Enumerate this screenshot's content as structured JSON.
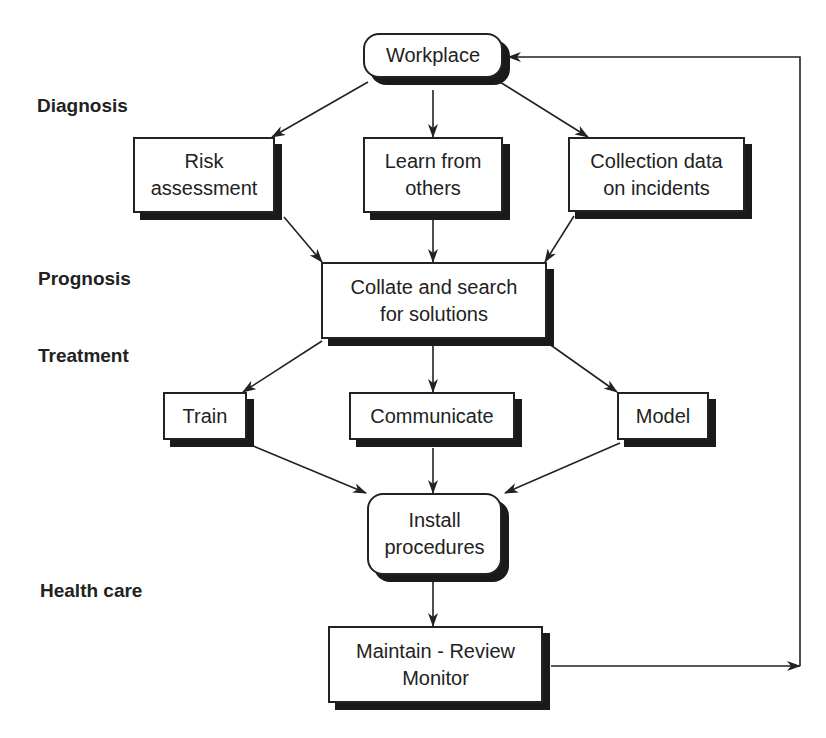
{
  "stages": [
    {
      "label": "Diagnosis"
    },
    {
      "label": "Prognosis"
    },
    {
      "label": "Treatment"
    },
    {
      "label": "Health care"
    }
  ],
  "nodes": {
    "workplace": {
      "label": "Workplace"
    },
    "risk": {
      "label": "Risk\nassessment"
    },
    "learn": {
      "label": "Learn from\nothers"
    },
    "collect": {
      "label": "Collection data\non incidents"
    },
    "collate": {
      "label": "Collate and search\nfor solutions"
    },
    "train": {
      "label": "Train"
    },
    "communicate": {
      "label": "Communicate"
    },
    "model": {
      "label": "Model"
    },
    "install": {
      "label": "Install\nprocedures"
    },
    "maintain": {
      "label": "Maintain - Review\nMonitor"
    }
  },
  "edges": [
    {
      "from": "workplace",
      "to": "risk"
    },
    {
      "from": "workplace",
      "to": "learn"
    },
    {
      "from": "workplace",
      "to": "collect"
    },
    {
      "from": "risk",
      "to": "collate"
    },
    {
      "from": "learn",
      "to": "collate"
    },
    {
      "from": "collect",
      "to": "collate"
    },
    {
      "from": "collate",
      "to": "train"
    },
    {
      "from": "collate",
      "to": "communicate"
    },
    {
      "from": "collate",
      "to": "model"
    },
    {
      "from": "train",
      "to": "install"
    },
    {
      "from": "communicate",
      "to": "install"
    },
    {
      "from": "model",
      "to": "install"
    },
    {
      "from": "install",
      "to": "maintain"
    },
    {
      "from": "maintain",
      "to": "workplace",
      "type": "feedback-loop"
    }
  ],
  "colors": {
    "line": "#222222",
    "shadow": "#1a1a1a",
    "background": "#ffffff"
  }
}
